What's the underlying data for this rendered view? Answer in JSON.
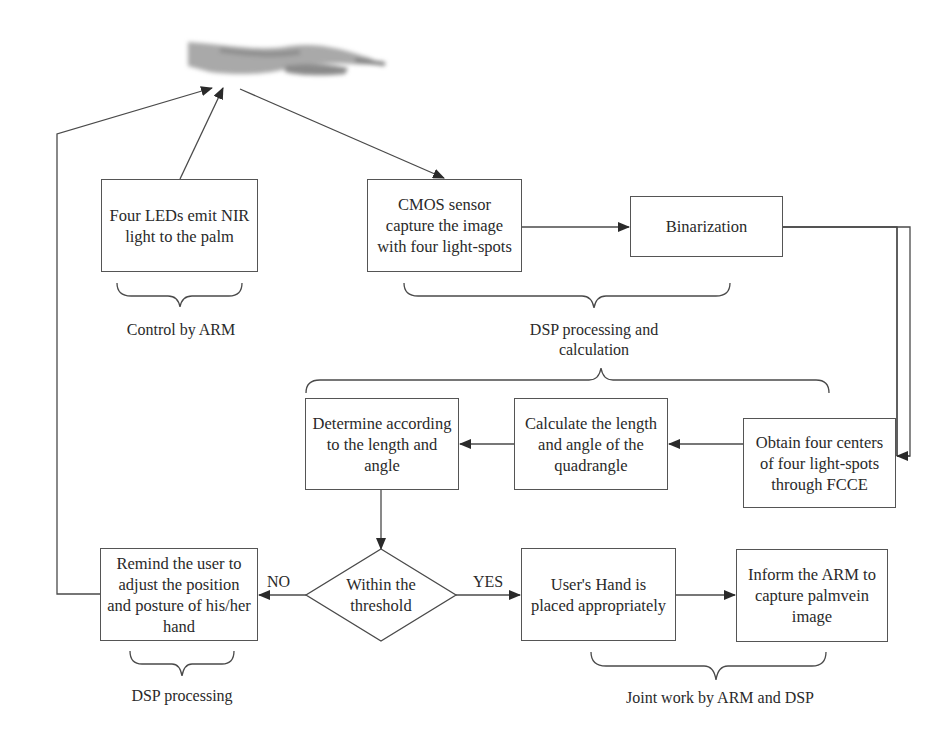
{
  "diagram": {
    "nodes": {
      "hand": {
        "label": "palm-image",
        "shape": "image"
      },
      "leds": {
        "text": "Four LEDs emit NIR light to the palm",
        "lines": [
          "Four LEDs emit",
          "NIR light to the",
          "palm"
        ]
      },
      "cmos": {
        "text": "CMOS sensor capture the image with four light-spots",
        "lines": [
          "CMOS sensor",
          "capture the image",
          "with four light-spots"
        ]
      },
      "binarization": {
        "text": "Binarization",
        "lines": [
          "Binarization"
        ]
      },
      "obtain": {
        "text": "Obtain four centers of four light-spots through FCCE",
        "lines": [
          "Obtain four centers",
          "of four light-spots",
          "through FCCE"
        ]
      },
      "calculate": {
        "text": "Calculate the length and angle of the quadrangle",
        "lines": [
          "Calculate the length",
          "and angle of the",
          "quadrangle"
        ]
      },
      "determine": {
        "text": "Determine according to the length and angle",
        "lines": [
          "Determine",
          "according to the",
          "length and angle"
        ]
      },
      "decision": {
        "text": "Within the threshold",
        "lines": [
          "Within the",
          "threshold"
        ],
        "shape": "diamond"
      },
      "remind": {
        "text": "Remind the user to adjust the position and posture of his/her hand",
        "lines": [
          "Remind the user to",
          "adjust the position",
          "and posture of his/",
          "her hand"
        ]
      },
      "placed": {
        "text": "User's Hand is placed appropriately",
        "lines": [
          "User’s Hand is",
          "placed appropriately"
        ]
      },
      "inform": {
        "text": "Inform the ARM to capture palmvein image",
        "lines": [
          "Inform the ARM",
          "to capture",
          "palmvein image"
        ]
      }
    },
    "edge_labels": {
      "no": "NO",
      "yes": "YES"
    },
    "group_labels": {
      "control_arm": "Control by ARM",
      "dsp_calc_line1": "DSP processing and",
      "dsp_calc_line2": "calculation",
      "dsp_processing": "DSP processing",
      "joint_work": "Joint work by ARM and DSP"
    },
    "edges": [
      {
        "from": "leds",
        "to": "hand"
      },
      {
        "from": "hand",
        "to": "cmos"
      },
      {
        "from": "cmos",
        "to": "binarization"
      },
      {
        "from": "binarization",
        "to": "obtain"
      },
      {
        "from": "obtain",
        "to": "calculate"
      },
      {
        "from": "calculate",
        "to": "determine"
      },
      {
        "from": "determine",
        "to": "decision"
      },
      {
        "from": "decision",
        "to": "remind",
        "label": "NO"
      },
      {
        "from": "decision",
        "to": "placed",
        "label": "YES"
      },
      {
        "from": "placed",
        "to": "inform"
      },
      {
        "from": "remind",
        "to": "hand"
      }
    ],
    "colors": {
      "line": "#4a4a4a",
      "text": "#2a2a2a",
      "background": "#ffffff",
      "hand": "#9a9a9a"
    }
  }
}
